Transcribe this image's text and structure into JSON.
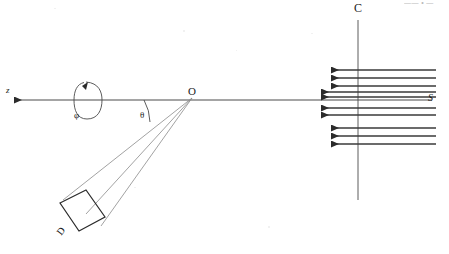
{
  "figure": {
    "domain": "Diagram",
    "kind": "optical-scattering-geometry",
    "width": 449,
    "height": 254,
    "background_color": "#ffffff",
    "line_color": "#3d3d3d",
    "label_color": "#1a1a1a"
  },
  "labels": {
    "z_axis": "z",
    "rotation_angle": "φ",
    "scattering_angle": "θ",
    "origin": "O",
    "detector": "D",
    "source": "S",
    "collimator": "C",
    "top_edge_artifact": "—— • —"
  },
  "geometry": {
    "axis": {
      "name": "optical-axis",
      "x1": 10,
      "y1": 100,
      "x2": 432,
      "y2": 100,
      "arrow_end": "left"
    },
    "origin_point": {
      "x": 192,
      "y": 98
    },
    "vertical_collimator": {
      "name": "collimator-line-C",
      "x": 358,
      "y1": 20,
      "y2": 200
    },
    "theta_arc": {
      "center": {
        "x": 192,
        "y": 98
      },
      "radius": 48,
      "start_deg": 180,
      "end_deg": 208,
      "label_position": {
        "x": 140,
        "y": 111
      }
    },
    "phi_loop": {
      "name": "azimuthal-rotation-loop",
      "center": {
        "x": 88,
        "y": 100
      },
      "rx": 13,
      "ry": 20,
      "arrow_at": "top-left"
    },
    "detector_box": {
      "name": "detector-D",
      "corners": [
        {
          "x": 60,
          "y": 203
        },
        {
          "x": 86,
          "y": 190
        },
        {
          "x": 105,
          "y": 217
        },
        {
          "x": 79,
          "y": 231
        }
      ]
    },
    "detector_rays": [
      {
        "from": {
          "x": 192,
          "y": 98
        },
        "to": {
          "x": 64,
          "y": 199
        }
      },
      {
        "from": {
          "x": 192,
          "y": 98
        },
        "to": {
          "x": 86,
          "y": 214
        }
      },
      {
        "from": {
          "x": 192,
          "y": 98
        },
        "to": {
          "x": 100,
          "y": 225
        }
      }
    ],
    "beam_arrows": {
      "note": "ten left-pointing parallel rays representing the incident beam from source S",
      "head_style": "solid-triangle",
      "direction": "left",
      "rows": [
        {
          "id": 1,
          "y": 70,
          "x_tip": 327,
          "x_tail": 436,
          "length_class": "short"
        },
        {
          "id": 2,
          "y": 78,
          "x_tip": 327,
          "x_tail": 436,
          "length_class": "short"
        },
        {
          "id": 3,
          "y": 86,
          "x_tip": 327,
          "x_tail": 436,
          "length_class": "short"
        },
        {
          "id": 4,
          "y": 92,
          "x_tip": 317,
          "x_tail": 436,
          "length_class": "long"
        },
        {
          "id": 5,
          "y": 97,
          "x_tip": 317,
          "x_tail": 436,
          "length_class": "long"
        },
        {
          "id": 6,
          "y": 108,
          "x_tip": 317,
          "x_tail": 436,
          "length_class": "long"
        },
        {
          "id": 7,
          "y": 115,
          "x_tip": 317,
          "x_tail": 436,
          "length_class": "long"
        },
        {
          "id": 8,
          "y": 128,
          "x_tip": 327,
          "x_tail": 436,
          "length_class": "short"
        },
        {
          "id": 9,
          "y": 136,
          "x_tip": 327,
          "x_tail": 436,
          "length_class": "short"
        },
        {
          "id": 10,
          "y": 144,
          "x_tip": 327,
          "x_tail": 436,
          "length_class": "short"
        }
      ]
    }
  }
}
